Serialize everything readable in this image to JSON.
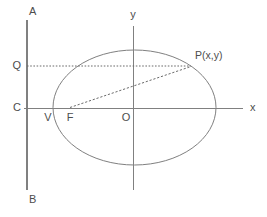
{
  "figure": {
    "background_color": "#ffffff",
    "line_color": "#808080",
    "text_color": "#4d4d4d",
    "dotted_color": "#6b6b6b"
  },
  "labels": {
    "directrix_top": "A",
    "directrix_bottom": "B",
    "directrix_foot": "C",
    "foot_of_perpendicular": "Q",
    "vertex": "V",
    "focus": "F",
    "origin": "O",
    "point_on_conic": "P(x,y)",
    "x_axis": "x",
    "y_axis": "y"
  },
  "geometry": {
    "directrix_x": 27,
    "directrix_y_top": 20,
    "directrix_y_bottom": 190,
    "x_axis_y": 108,
    "x_axis_x_start": 24,
    "x_axis_x_end": 243,
    "y_axis_x": 133,
    "y_axis_y_top": 26,
    "y_axis_y_bottom": 190,
    "ellipse_center_x": 134.5,
    "ellipse_center_y": 107.5,
    "ellipse_semi_major": 81.5,
    "ellipse_semi_minor": 57.5,
    "point_Q": [
      27,
      66
    ],
    "point_P": [
      191,
      66
    ],
    "point_F": [
      70,
      107.5
    ],
    "point_V": [
      53,
      107.5
    ]
  }
}
